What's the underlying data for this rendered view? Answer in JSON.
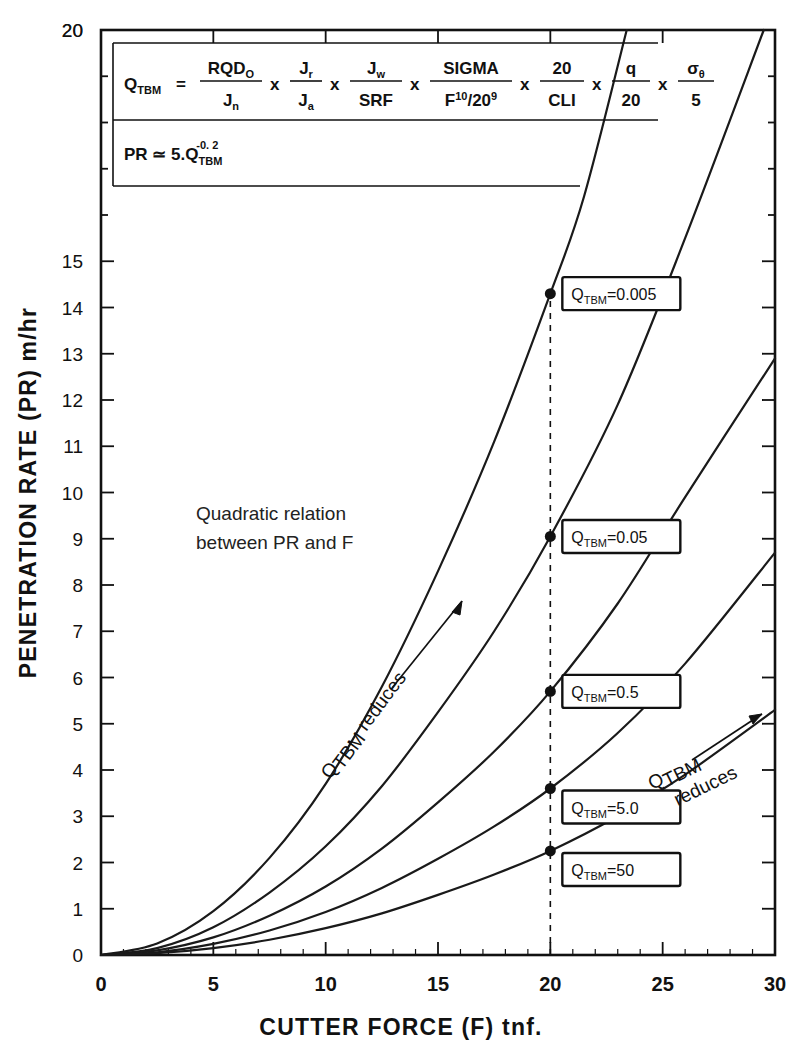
{
  "chart_data": {
    "type": "line",
    "title": "",
    "xlabel": "CUTTER  FORCE  (F)  tnf.",
    "ylabel": "PENETRATION  RATE  (PR)  m/hr",
    "xlim": [
      0,
      30
    ],
    "ylim": [
      0,
      20
    ],
    "xticks": [
      0,
      5,
      10,
      15,
      20,
      25,
      30
    ],
    "xticklabels": [
      "0",
      "5",
      "10",
      "15",
      "20",
      "25",
      "30"
    ],
    "yticks": [
      0,
      1,
      2,
      3,
      4,
      5,
      6,
      7,
      8,
      9,
      10,
      11,
      12,
      13,
      14,
      15,
      16,
      17,
      18,
      19,
      20
    ],
    "yticklabels": [
      "0",
      "1",
      "2",
      "3",
      "4",
      "5",
      "6",
      "7",
      "8",
      "9",
      "10",
      "11",
      "12",
      "13",
      "14",
      "15",
      "",
      "",
      "",
      "",
      "20"
    ],
    "grid": false,
    "legend": "none",
    "guide_line_x": 20,
    "series": [
      {
        "name": "Q_TBM=0.005",
        "label": "Q",
        "label_sub": "TBM",
        "label_value": "=0.005",
        "marker_x": 20,
        "marker_y": 14.3,
        "x": [
          0,
          2.5,
          5,
          7.5,
          10,
          12.5,
          15,
          17.5,
          20,
          21.5,
          23.4
        ],
        "y": [
          0,
          0.25,
          0.95,
          2.1,
          3.7,
          5.8,
          8.3,
          11.1,
          14.3,
          16.4,
          20.0
        ]
      },
      {
        "name": "Q_TBM=0.05",
        "label": "Q",
        "label_sub": "TBM",
        "label_value": "=0.05",
        "marker_x": 20,
        "marker_y": 9.05,
        "x": [
          0,
          2.5,
          5,
          7.5,
          10,
          12.5,
          15,
          17.5,
          20,
          23,
          26,
          29.5
        ],
        "y": [
          0,
          0.15,
          0.6,
          1.35,
          2.35,
          3.65,
          5.25,
          7.0,
          9.05,
          11.9,
          15.5,
          20.0
        ]
      },
      {
        "name": "Q_TBM=0.5",
        "label": "Q",
        "label_sub": "TBM",
        "label_value": "=0.5",
        "marker_x": 20,
        "marker_y": 5.7,
        "x": [
          0,
          2.5,
          5,
          7.5,
          10,
          12.5,
          15,
          17.5,
          20,
          23,
          26,
          30
        ],
        "y": [
          0,
          0.1,
          0.38,
          0.85,
          1.48,
          2.3,
          3.3,
          4.4,
          5.7,
          7.6,
          9.9,
          12.9
        ]
      },
      {
        "name": "Q_TBM=5.0",
        "label": "Q",
        "label_sub": "TBM",
        "label_value": "=5.0",
        "marker_x": 20,
        "marker_y": 3.6,
        "x": [
          0,
          2.5,
          5,
          7.5,
          10,
          12.5,
          15,
          17.5,
          20,
          23,
          26,
          30
        ],
        "y": [
          0,
          0.06,
          0.24,
          0.53,
          0.93,
          1.45,
          2.08,
          2.78,
          3.6,
          4.8,
          6.3,
          8.7
        ]
      },
      {
        "name": "Q_TBM=50",
        "label": "Q",
        "label_sub": "TBM",
        "label_value": "=50",
        "marker_x": 20,
        "marker_y": 2.25,
        "x": [
          0,
          2.5,
          5,
          7.5,
          10,
          12.5,
          15,
          17.5,
          20,
          23,
          26,
          30
        ],
        "y": [
          0,
          0.04,
          0.15,
          0.33,
          0.58,
          0.9,
          1.3,
          1.74,
          2.25,
          3.0,
          3.9,
          5.3
        ]
      }
    ],
    "annotations": [
      {
        "id": "quadratic-note",
        "line1": "Quadratic relation",
        "line2": "between PR and F"
      },
      {
        "id": "left-reduces",
        "text_main": "Q",
        "text_sub": "TBM",
        "text_rest": " reduces"
      },
      {
        "id": "right-reduces",
        "text_main": "Q",
        "text_sub": "TBM",
        "text_rest": "reduces"
      }
    ]
  },
  "formula_panel": {
    "qtbm": {
      "lhs": "Q",
      "lhs_sub": "TBM",
      "eq": "=",
      "terms": [
        {
          "num": "RQD",
          "num_sub": "O",
          "den": "J",
          "den_sub": "n"
        },
        {
          "num": "J",
          "num_sub": "r",
          "den": "J",
          "den_sub": "a"
        },
        {
          "num": "J",
          "num_sub": "w",
          "den": "SRF",
          "den_sub": ""
        },
        {
          "num": "SIGMA",
          "num_sub": "",
          "den": "F",
          "den_sup": "10",
          "den_tail": "/20",
          "den_tail_sup": "9"
        },
        {
          "num": "20",
          "num_sub": "",
          "den": "CLI",
          "den_sub": ""
        },
        {
          "num": "q",
          "num_sub": "",
          "den": "20",
          "den_sub": ""
        },
        {
          "num": "σ",
          "num_sub": "θ",
          "den": "5",
          "den_sub": ""
        }
      ],
      "multiply": "x"
    },
    "pr": {
      "lhs": "PR",
      "eq": "≃",
      "coef": "5.Q",
      "coef_sub": "TBM",
      "exp": "-0. 2"
    }
  },
  "colors": {
    "ink": "#111111",
    "background": "#ffffff",
    "curve": "#1a1a1a"
  }
}
